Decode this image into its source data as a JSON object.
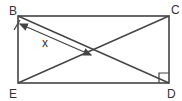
{
  "diagram": {
    "type": "geometry-rectangle-diagonals",
    "vertices": {
      "B": {
        "label": "B",
        "x": 18,
        "y": 16
      },
      "C": {
        "label": "C",
        "x": 169,
        "y": 16
      },
      "D": {
        "label": "D",
        "x": 169,
        "y": 83
      },
      "E": {
        "label": "E",
        "x": 18,
        "y": 83
      }
    },
    "diagonals": [
      "BD",
      "EC"
    ],
    "right_angle_at": "D",
    "measurement": {
      "label": "x",
      "from": "B",
      "to": "intersection"
    },
    "colors": {
      "stroke": "#444444",
      "background": "#ffffff"
    }
  }
}
